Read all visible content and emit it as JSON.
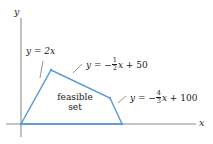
{
  "figure": {
    "type": "linear-programming-feasible-region",
    "axes": {
      "x_label": "x",
      "y_label": "y",
      "origin_px": [
        21,
        124
      ],
      "x_axis_end_px": [
        196,
        124
      ],
      "y_axis_top_px": [
        21,
        18
      ]
    },
    "region": {
      "label_line1": "feasible",
      "label_line2": "set",
      "fill": "none",
      "stroke": "#5b9bd5",
      "vertices_px": [
        [
          21,
          124
        ],
        [
          51,
          70
        ],
        [
          110,
          98
        ],
        [
          122,
          124
        ]
      ]
    },
    "constraints": [
      {
        "id": "line-y-equals-2x",
        "text": "y = 2x",
        "lhs": "y",
        "slope": "2",
        "intercept": "0",
        "label_pos_px": [
          26,
          52
        ]
      },
      {
        "id": "line-neg-half-x-plus-50",
        "text_prefix": "y = −",
        "frac_num": "1",
        "frac_den": "2",
        "text_mid": "x",
        "text_suffix": "+ 50",
        "intercept": "50",
        "label_pos_px": [
          84,
          60
        ]
      },
      {
        "id": "line-neg-four-thirds-x-plus-100",
        "text_prefix": "y = −",
        "frac_num": "4",
        "frac_den": "3",
        "text_mid": "x",
        "text_suffix": "+ 100",
        "intercept": "100",
        "label_pos_px": [
          128,
          92
        ]
      }
    ],
    "colors": {
      "line": "#5b9bd5",
      "axis": "#8a8a8a",
      "text": "#1a1a1a",
      "leader": "#7a7a7a",
      "background": "#ffffff"
    }
  }
}
